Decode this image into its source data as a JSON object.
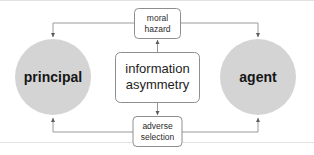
{
  "diagram": {
    "title": "information asymmetry",
    "type": "concept-diagram",
    "background_color": "#ffffff",
    "line_color": "#9a9a9a",
    "circle_fill_color": "#d4d4d4",
    "box_fill_color": "#ffffff",
    "box_border_color": "#8e8e8e",
    "text_color": "#1d1d1d",
    "nodes": {
      "principal": {
        "label": "principal",
        "shape": "circle"
      },
      "agent": {
        "label": "agent",
        "shape": "circle"
      },
      "center": {
        "line1": "information",
        "line2": "asymmetry",
        "shape": "rounded-rect"
      },
      "moral_hazard": {
        "line1": "moral",
        "line2": "hazard",
        "shape": "rounded-rect"
      },
      "adverse_selection": {
        "line1": "adverse",
        "line2": "selection",
        "shape": "rounded-rect"
      }
    },
    "connections": [
      {
        "from": "center",
        "to": "moral_hazard",
        "direction": "up"
      },
      {
        "from": "center",
        "to": "adverse_selection",
        "direction": "down"
      },
      {
        "from": "moral_hazard",
        "to": "principal",
        "direction": "left-down"
      },
      {
        "from": "moral_hazard",
        "to": "agent",
        "direction": "right-down"
      },
      {
        "from": "adverse_selection",
        "to": "principal",
        "direction": "left-up"
      },
      {
        "from": "adverse_selection",
        "to": "agent",
        "direction": "right-up"
      }
    ]
  }
}
